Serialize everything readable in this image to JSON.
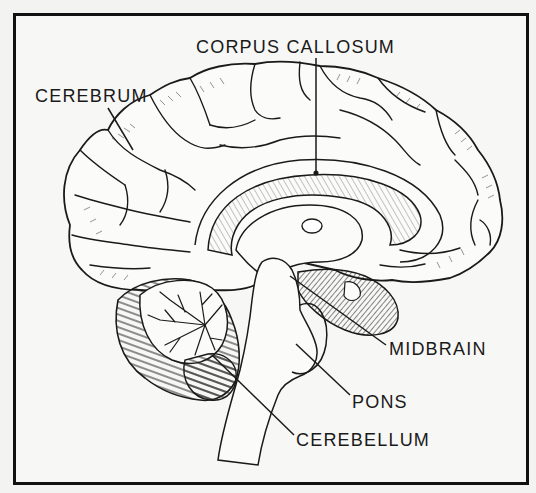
{
  "diagram": {
    "type": "anatomical-sagittal-section",
    "labels": [
      {
        "id": "corpus-callosum",
        "text": "CORPUS CALLOSUM"
      },
      {
        "id": "cerebrum",
        "text": "CEREBRUM"
      },
      {
        "id": "midbrain",
        "text": "MIDBRAIN"
      },
      {
        "id": "pons",
        "text": "PONS"
      },
      {
        "id": "cerebellum",
        "text": "CEREBELLUM"
      }
    ],
    "colors": {
      "ink": "#1a1a1a",
      "paper": "#f7f7f5",
      "frame": "#111111"
    }
  }
}
